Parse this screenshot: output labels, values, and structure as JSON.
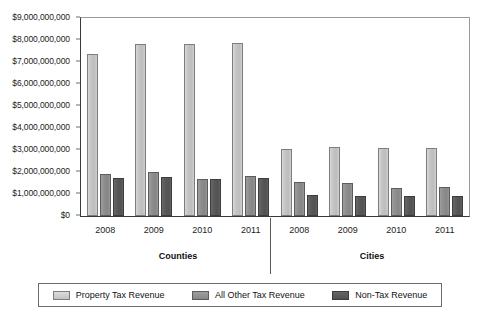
{
  "chart_data": {
    "type": "bar",
    "title": "",
    "xlabel": "",
    "ylabel": "",
    "ylim": [
      0,
      9000000000
    ],
    "grid": false,
    "legend_position": "bottom",
    "y_ticks": [
      "$0",
      "$1,000,000,000",
      "$2,000,000,000",
      "$3,000,000,000",
      "$4,000,000,000",
      "$5,000,000,000",
      "$6,000,000,000",
      "$7,000,000,000",
      "$8,000,000,000",
      "$9,000,000,000"
    ],
    "y_tick_values": [
      0,
      1000000000,
      2000000000,
      3000000000,
      4000000000,
      5000000000,
      6000000000,
      7000000000,
      8000000000,
      9000000000
    ],
    "categories": [
      "2008",
      "2009",
      "2010",
      "2011"
    ],
    "groups": [
      {
        "name": "Counties",
        "categories": [
          "2008",
          "2009",
          "2010",
          "2011"
        ],
        "series": [
          {
            "name": "Property Tax Revenue",
            "values": [
              7350000000,
              7820000000,
              7810000000,
              7870000000
            ]
          },
          {
            "name": "All Other Tax Revenue",
            "values": [
              1900000000,
              1990000000,
              1700000000,
              1830000000
            ]
          },
          {
            "name": "Non-Tax Revenue",
            "values": [
              1720000000,
              1760000000,
              1700000000,
              1730000000
            ]
          }
        ]
      },
      {
        "name": "Cities",
        "categories": [
          "2008",
          "2009",
          "2010",
          "2011"
        ],
        "series": [
          {
            "name": "Property Tax Revenue",
            "values": [
              3040000000,
              3140000000,
              3110000000,
              3090000000
            ]
          },
          {
            "name": "All Other Tax Revenue",
            "values": [
              1540000000,
              1480000000,
              1290000000,
              1330000000
            ]
          },
          {
            "name": "Non-Tax Revenue",
            "values": [
              960000000,
              890000000,
              910000000,
              920000000
            ]
          }
        ]
      }
    ],
    "legend": [
      {
        "label": "Property Tax Revenue",
        "color": "#c6c6c6"
      },
      {
        "label": "All Other Tax Revenue",
        "color": "#8e8e8e"
      },
      {
        "label": "Non-Tax Revenue",
        "color": "#595959"
      }
    ]
  }
}
